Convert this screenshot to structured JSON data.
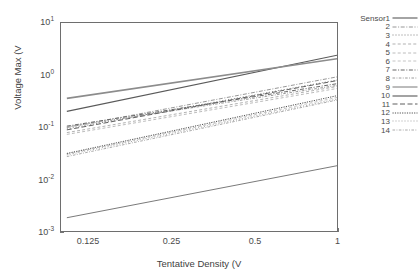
{
  "chart_data": {
    "type": "line",
    "title": "",
    "xlabel": "Tentative Density (V",
    "ylabel": "Voltage Max (V",
    "xscale": "log",
    "yscale": "log",
    "xlim": [
      0.1,
      1
    ],
    "ylim": [
      0.001,
      10
    ],
    "xticks": [
      0.125,
      0.25,
      0.5,
      1
    ],
    "xtick_labels": [
      "0.125",
      "0.25",
      "0.5",
      "1"
    ],
    "yticks": [
      0.001,
      0.01,
      0.1,
      1,
      10
    ],
    "ytick_labels": [
      "10-3",
      "10-2",
      "10-1",
      "100",
      "101"
    ],
    "ytick_mantissa": [
      "10",
      "10",
      "10",
      "10",
      "10"
    ],
    "ytick_exponent": [
      "-3",
      "-2",
      "-1",
      "0",
      "1"
    ],
    "grid": false,
    "legend_position": "right-outside",
    "x": [
      0.105,
      1.0
    ],
    "series": [
      {
        "name": "Sensor1",
        "label": "Sensor1",
        "values": [
          0.2,
          2.4
        ],
        "style": "solid",
        "width": 1.1,
        "color": "#5a5a5a"
      },
      {
        "name": "Sensor2",
        "label": "2",
        "values": [
          0.098,
          0.92
        ],
        "style": "dashdot",
        "width": 0.9,
        "color": "#8a8a8a"
      },
      {
        "name": "Sensor3",
        "label": "3",
        "values": [
          0.092,
          0.8
        ],
        "style": "dotted",
        "width": 0.9,
        "color": "#707070"
      },
      {
        "name": "Sensor4",
        "label": "4",
        "values": [
          0.078,
          0.6
        ],
        "style": "dashed-fine",
        "width": 0.9,
        "color": "#a8a8a8"
      },
      {
        "name": "Sensor5",
        "label": "5",
        "values": [
          0.072,
          0.55
        ],
        "style": "dashed-fine",
        "width": 0.9,
        "color": "#b4b4b4"
      },
      {
        "name": "Sensor6",
        "label": "6",
        "values": [
          0.03,
          0.37
        ],
        "style": "dashed-fine",
        "width": 0.9,
        "color": "#bdbdbd"
      },
      {
        "name": "Sensor7",
        "label": "7",
        "values": [
          0.104,
          0.68
        ],
        "style": "dashdot",
        "width": 1.0,
        "color": "#666666"
      },
      {
        "name": "Sensor8",
        "label": "8",
        "values": [
          0.1,
          0.63
        ],
        "style": "dashdot-fine",
        "width": 0.9,
        "color": "#8f8f8f"
      },
      {
        "name": "Sensor9",
        "label": "9",
        "values": [
          0.0018,
          0.018
        ],
        "style": "solid",
        "width": 0.9,
        "color": "#6a6a6a"
      },
      {
        "name": "Sensor10",
        "label": "10",
        "values": [
          0.355,
          2.05
        ],
        "style": "solid",
        "width": 1.6,
        "color": "#8c8c8c"
      },
      {
        "name": "Sensor11",
        "label": "11",
        "values": [
          0.088,
          0.78
        ],
        "style": "dashed",
        "width": 1.0,
        "color": "#5f5f5f"
      },
      {
        "name": "Sensor12",
        "label": "12",
        "values": [
          0.031,
          0.4
        ],
        "style": "dotted-dense",
        "width": 1.0,
        "color": "#4f4f4f"
      },
      {
        "name": "Sensor13",
        "label": "13",
        "values": [
          0.029,
          0.345
        ],
        "style": "dotted",
        "width": 0.9,
        "color": "#9a9a9a"
      },
      {
        "name": "Sensor14",
        "label": "14",
        "values": [
          0.027,
          0.33
        ],
        "style": "dashdot-fine",
        "width": 0.9,
        "color": "#a0a0a0"
      }
    ]
  },
  "axes": {
    "ytick_labels": [
      {
        "m": "10",
        "e": "1"
      },
      {
        "m": "10",
        "e": "0"
      },
      {
        "m": "10",
        "e": "-1"
      },
      {
        "m": "10",
        "e": "-2"
      },
      {
        "m": "10",
        "e": "-3"
      }
    ],
    "xtick_labels": [
      "0.125",
      "0.25",
      "0.5",
      "1"
    ],
    "xlabel": "Tentative Density (V",
    "ylabel": "Voltage Max (V"
  }
}
